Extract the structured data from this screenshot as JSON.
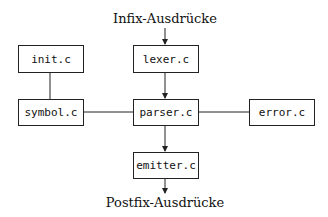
{
  "diagram": {
    "input_label": "Infix-Ausdrücke",
    "output_label": "Postfix-Ausdrücke",
    "modules": {
      "init": "init.c",
      "lexer": "lexer.c",
      "symbol": "symbol.c",
      "parser": "parser.c",
      "error": "error.c",
      "emitter": "emitter.c"
    },
    "edges": [
      {
        "from": "Infix-Ausdrücke",
        "to": "lexer.c",
        "arrow": true
      },
      {
        "from": "lexer.c",
        "to": "parser.c",
        "arrow": true
      },
      {
        "from": "init.c",
        "to": "symbol.c",
        "arrow": false
      },
      {
        "from": "symbol.c",
        "to": "parser.c",
        "arrow": false
      },
      {
        "from": "parser.c",
        "to": "error.c",
        "arrow": false
      },
      {
        "from": "parser.c",
        "to": "emitter.c",
        "arrow": true
      },
      {
        "from": "emitter.c",
        "to": "Postfix-Ausdrücke",
        "arrow": true
      }
    ],
    "colors": {
      "stroke": "#222222",
      "background": "#ffffff"
    }
  }
}
